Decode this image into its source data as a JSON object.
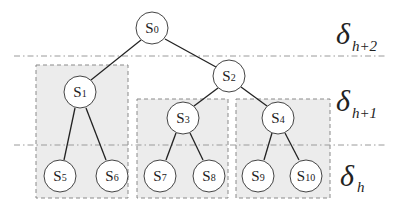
{
  "diagram": {
    "type": "tree",
    "nodes": [
      {
        "id": "s0",
        "base": "S",
        "sub": "0",
        "cx": 152,
        "cy": 28
      },
      {
        "id": "s1",
        "base": "S",
        "sub": "1",
        "cx": 80,
        "cy": 92
      },
      {
        "id": "s2",
        "base": "S",
        "sub": "2",
        "cx": 229,
        "cy": 76
      },
      {
        "id": "s3",
        "base": "S",
        "sub": "3",
        "cx": 183,
        "cy": 118
      },
      {
        "id": "s4",
        "base": "S",
        "sub": "4",
        "cx": 278,
        "cy": 118
      },
      {
        "id": "s5",
        "base": "S",
        "sub": "5",
        "cx": 60,
        "cy": 176
      },
      {
        "id": "s6",
        "base": "S",
        "sub": "6",
        "cx": 112,
        "cy": 176
      },
      {
        "id": "s7",
        "base": "S",
        "sub": "7",
        "cx": 160,
        "cy": 176
      },
      {
        "id": "s8",
        "base": "S",
        "sub": "8",
        "cx": 209,
        "cy": 176
      },
      {
        "id": "s9",
        "base": "S",
        "sub": "9",
        "cx": 258,
        "cy": 176
      },
      {
        "id": "s10",
        "base": "S",
        "sub": "10",
        "cx": 306,
        "cy": 176
      }
    ],
    "edges": [
      [
        "s0",
        "s1"
      ],
      [
        "s0",
        "s2"
      ],
      [
        "s2",
        "s3"
      ],
      [
        "s2",
        "s4"
      ],
      [
        "s1",
        "s5"
      ],
      [
        "s1",
        "s6"
      ],
      [
        "s3",
        "s7"
      ],
      [
        "s3",
        "s8"
      ],
      [
        "s4",
        "s9"
      ],
      [
        "s4",
        "s10"
      ]
    ],
    "levels": [
      {
        "symbol": "δ",
        "sub": "h+2"
      },
      {
        "symbol": "δ",
        "sub": "h+1"
      },
      {
        "symbol": "δ",
        "sub": "h"
      }
    ],
    "colors": {
      "node_fill": "#ffffff",
      "node_stroke": "#444444",
      "edge": "#222222",
      "group_fill": "#ececec",
      "group_stroke": "#888888",
      "level_line": "#999999"
    }
  }
}
